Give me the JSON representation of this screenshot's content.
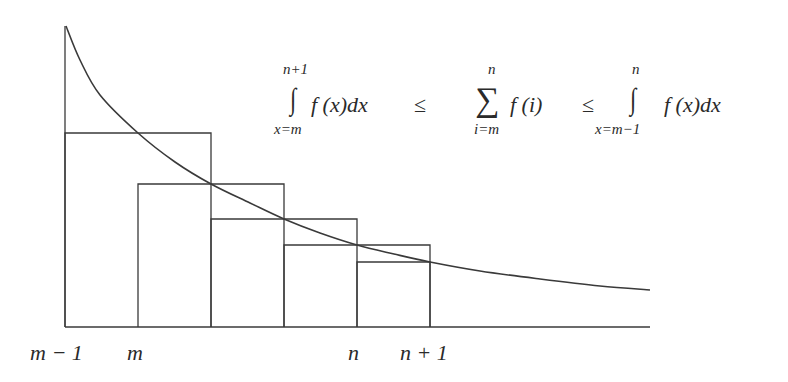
{
  "diagram": {
    "type": "integral-test-bounds",
    "colors": {
      "stroke": "#3a3a3a",
      "text": "#2a2a2a",
      "background": "#ffffff"
    },
    "axis": {
      "x_start": 65,
      "x_end": 650,
      "y": 327
    },
    "curve_points": [
      [
        66,
        26
      ],
      [
        80,
        60
      ],
      [
        100,
        95
      ],
      [
        138,
        133
      ],
      [
        175,
        162
      ],
      [
        211,
        184
      ],
      [
        250,
        203
      ],
      [
        284,
        219
      ],
      [
        320,
        233
      ],
      [
        357,
        245
      ],
      [
        394,
        254
      ],
      [
        430,
        262
      ],
      [
        480,
        271
      ],
      [
        540,
        279
      ],
      [
        600,
        286
      ],
      [
        650,
        290
      ]
    ],
    "rectangles": [
      {
        "label": "upper-rect-1",
        "x1": 65,
        "x2": 211,
        "top": 133
      },
      {
        "label": "upper-rect-2",
        "x1": 138,
        "x2": 284,
        "top": 184
      },
      {
        "label": "upper-rect-3",
        "x1": 211,
        "x2": 357,
        "top": 219
      },
      {
        "label": "upper-rect-4",
        "x1": 284,
        "x2": 430,
        "top": 245
      },
      {
        "label": "lower-rect-5",
        "x1": 357,
        "x2": 430,
        "top": 262
      }
    ],
    "x_labels": [
      {
        "text": "m − 1",
        "x": 30
      },
      {
        "text": "m",
        "x": 127
      },
      {
        "text": "n",
        "x": 348
      },
      {
        "text": "n + 1",
        "x": 400
      }
    ]
  },
  "formula": {
    "int1_upper": "n+1",
    "int1_lower": "x=m",
    "int1_body": "f (x)dx",
    "leq1": "≤",
    "sum_upper": "n",
    "sum_lower": "i=m",
    "sum_body": "f (i)",
    "leq2": "≤",
    "int2_upper": "n",
    "int2_lower": "x=m−1",
    "int2_body": "f (x)dx",
    "integral_symbol": "∫",
    "sum_symbol": "∑"
  }
}
